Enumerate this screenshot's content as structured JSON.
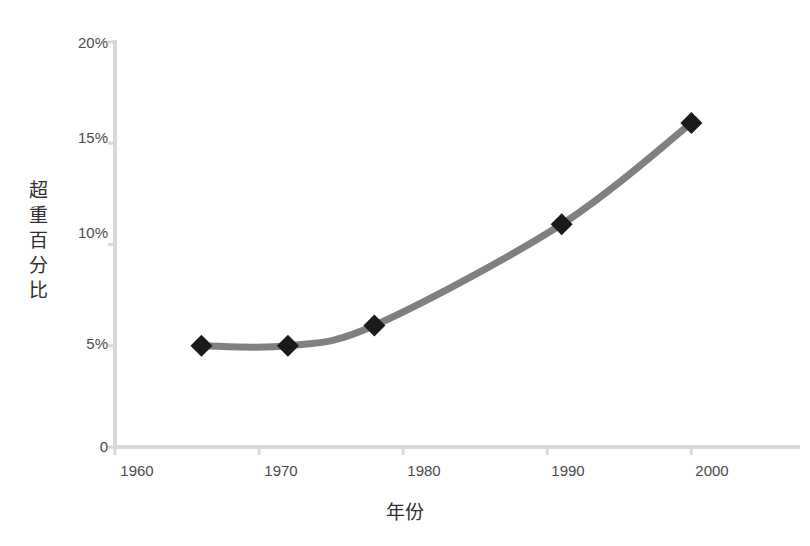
{
  "chart_data": {
    "type": "line",
    "title": "",
    "xlabel": "年份",
    "ylabel": "超重百分比",
    "ylabel_chars": [
      "超",
      "重",
      "百",
      "分",
      "比"
    ],
    "x": [
      1966,
      1972,
      1978,
      1991,
      2000
    ],
    "values": [
      5,
      5,
      6,
      11,
      16
    ],
    "series": [
      {
        "name": "超重百分比",
        "x": [
          1966,
          1972,
          1978,
          1991,
          2000
        ],
        "values": [
          5,
          5,
          6,
          11,
          16
        ]
      }
    ],
    "xlim": [
      1960,
      2004
    ],
    "ylim": [
      0,
      20
    ],
    "xticks": [
      1960,
      1970,
      1980,
      1990,
      2000
    ],
    "xtick_labels": [
      "1960",
      "1970",
      "1980",
      "1990",
      "2000"
    ],
    "yticks": [
      0,
      5,
      10,
      15,
      20
    ],
    "ytick_labels": [
      "0",
      "5%",
      "10%",
      "15%",
      "20%"
    ],
    "grid": false,
    "legend": "none",
    "marker": "diamond",
    "line_color": "#808080",
    "marker_color": "#1a1a1a",
    "axis_color": "#d9d9d9",
    "smooth": true
  },
  "axis": {
    "y_ticks": [
      {
        "label": "20%",
        "top": 34
      },
      {
        "label": "15%",
        "top": 129
      },
      {
        "label": "10%",
        "top": 224
      },
      {
        "label": "5%",
        "top": 335
      },
      {
        "label": "0",
        "top": 438
      }
    ],
    "x_ticks": [
      {
        "label": "1960",
        "left": 97
      },
      {
        "label": "1970",
        "left": 241
      },
      {
        "label": "1980",
        "left": 384
      },
      {
        "label": "1990",
        "left": 528
      },
      {
        "label": "2000",
        "left": 672
      }
    ]
  }
}
